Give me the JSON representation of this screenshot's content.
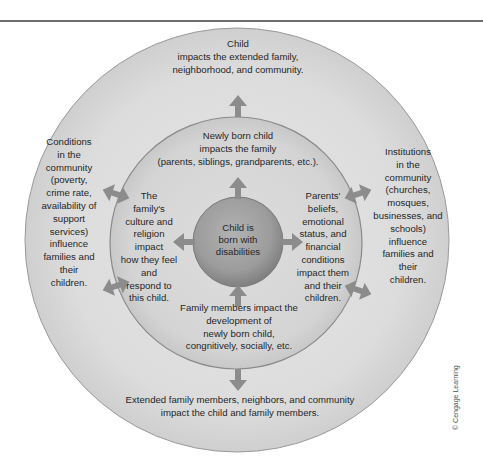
{
  "figure": {
    "type": "concentric-circles",
    "colors": {
      "outer_ring": "#dcdcdc",
      "middle_ring": "#d2d2d2",
      "inner_circle": "#9a9a9a",
      "arrow": "#8c8c8c",
      "stroke": "#8a8a8a",
      "rule": "#6e6e6e"
    },
    "rings": {
      "inner": {
        "label": "Child is\nborn with\ndisabilities"
      },
      "middle": {
        "top_label": "Newly born child\nimpacts the family\n(parents, siblings, grandparents, etc.).",
        "left_label": "The\nfamily's\nculture and\nreligion\nimpact\nhow they feel\nand\nrespond to\nthis child.",
        "right_label": "Parents'\nbeliefs,\nemotional\nstatus, and\nfinancial\nconditions\nimpact them\nand their\nchildren.",
        "bottom_label": "Family members impact the\ndevelopment of\nnewly born child,\ncongnitively, socially, etc."
      },
      "outer": {
        "top_label": "Child\nimpacts the extended family,\nneighborhood, and community.",
        "left_label": "Conditions\nin the\ncommunity\n(poverty,\ncrime rate,\navailability of\nsupport\nservices)\ninfluence\nfamilies and\ntheir\nchildren.",
        "right_label": "Institutions\nin the\ncommunity\n(churches,\nmosques,\nbusinesses, and\nschools)\ninfluence\nfamilies and\ntheir\nchildren.",
        "bottom_label": "Extended family members, neighbors, and community\nimpact the child and family members."
      }
    },
    "arrows": [
      {
        "name": "inner-to-middle-up",
        "direction": "up"
      },
      {
        "name": "inner-to-middle-down",
        "direction": "up-from-bottom"
      },
      {
        "name": "inner-left",
        "direction": "left"
      },
      {
        "name": "inner-right",
        "direction": "right"
      },
      {
        "name": "middle-to-outer-up",
        "direction": "up"
      },
      {
        "name": "middle-to-outer-down",
        "direction": "down"
      },
      {
        "name": "left-upper",
        "direction": "bidirectional"
      },
      {
        "name": "left-lower",
        "direction": "bidirectional"
      },
      {
        "name": "right-upper",
        "direction": "bidirectional"
      },
      {
        "name": "right-lower",
        "direction": "bidirectional"
      }
    ],
    "credit": "© Cengage Learning"
  }
}
